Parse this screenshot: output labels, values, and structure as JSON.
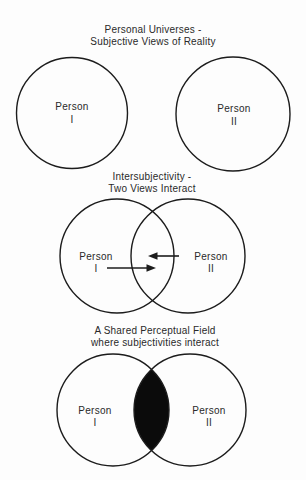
{
  "colors": {
    "background": "#fdfdfd",
    "text": "#2a2a2a",
    "line": "#1c1c1c",
    "lens": "#0b0b0b"
  },
  "sections": {
    "personal_universes": {
      "title_line1": "Personal Universes -",
      "title_line2": "Subjective Views of Reality",
      "left": {
        "label_line1": "Person",
        "label_line2": "I"
      },
      "right": {
        "label_line1": "Person",
        "label_line2": "II"
      }
    },
    "intersubjectivity": {
      "title_line1": "Intersubjectivity -",
      "title_line2": "Two Views Interact",
      "left": {
        "label_line1": "Person",
        "label_line2": "I"
      },
      "right": {
        "label_line1": "Person",
        "label_line2": "II"
      }
    },
    "shared_field": {
      "title_line1": "A Shared Perceptual Field",
      "title_line2": "where subjectivities interact",
      "left": {
        "label_line1": "Person",
        "label_line2": "I"
      },
      "right": {
        "label_line1": "Person",
        "label_line2": "II"
      }
    }
  }
}
